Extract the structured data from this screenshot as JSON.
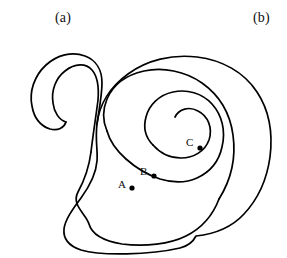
{
  "figure": {
    "kind": "line-drawing",
    "width": 287,
    "height": 258,
    "background_color": "#ffffff",
    "stroke_color": "#000000",
    "stroke_width": 1.7
  },
  "panels": [
    {
      "id": "a",
      "label": "(a)"
    },
    {
      "id": "b",
      "label": "(b)"
    }
  ],
  "points": [
    {
      "id": "A",
      "label": "A",
      "x": 132,
      "y": 188,
      "radius": 2.6,
      "color": "#000000"
    },
    {
      "id": "B",
      "label": "B",
      "x": 154,
      "y": 176,
      "radius": 2.6,
      "color": "#000000"
    },
    {
      "id": "C",
      "label": "C",
      "x": 200,
      "y": 148,
      "radius": 2.6,
      "color": "#000000"
    }
  ],
  "paths": {
    "outer_edge": "M 199 220 C 233 220 250 208 259 191 C 268 174 272 152 270 132 C 268 110 259 90 243 77 C 225 62 200 56 176 58 C 152 60 131 70 119 86 C 107 101 103 120 105 135",
    "outer_edge_lower_left": "M 105 135 C 103 152 96 167 88 180 C 80 194 72 206 70 216 C 68 227 74 236 86 243 C 102 252 135 254 166 252 C 182 251 192 248 199 220",
    "tail_outer": "M 105 135 C 107 120 110 104 110 90 C 110 76 105 66 95 62 C 83 57 70 59 60 67 C 49 76 44 90 46 103 C 47 113 52 120 60 122",
    "tail_inner": "M 60 122 C 53 120 50 112 50 104 C 49 92 54 81 63 75 C 72 69 82 69 88 74 C 93 79 95 87 94 97 C 93 111 90 128 88 143",
    "band_second_outer": "M 88 143 C 86 160 80 174 74 187 C 68 200 64 211 66 221 C 68 233 80 242 98 247 C 120 252 152 252 175 246 C 196 240 210 229 218 213",
    "band_second_upper": "M 218 213 C 228 195 232 172 229 151 C 226 130 217 113 203 101 C 188 89 168 84 149 87 C 132 90 119 99 113 112 C 108 123 108 133 112 141",
    "band_third": "M 112 141 C 115 150 120 157 126 163 C 134 171 143 177 152 181 C 163 186 174 188 184 186 C 197 184 206 177 211 167 C 217 155 217 140 211 128 C 205 116 194 108 181 106 C 169 104 158 109 152 118 C 147 126 147 136 152 143",
    "band_inner_tip": "M 152 143 C 157 151 166 156 175 156 C 186 156 194 150 197 141 C 200 131 196 121 188 117 C 181 113 173 116 170 123"
  },
  "colors": {
    "ink": "#000000",
    "paper": "#ffffff",
    "label_ink": "#101010"
  }
}
